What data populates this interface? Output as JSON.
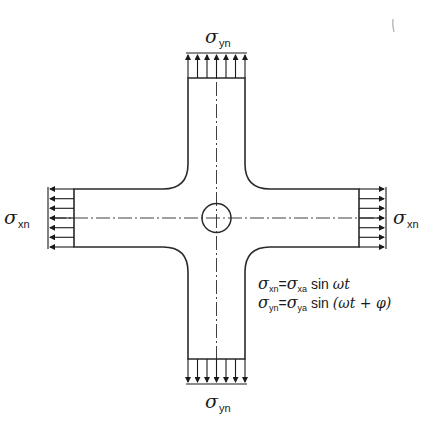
{
  "diagram": {
    "type": "cruciform specimen under biaxial sinusoidal loading",
    "colors": {
      "line": "#2a2a2a",
      "background": "#ffffff"
    },
    "labels": {
      "top": {
        "symbol": "σ",
        "sub": "yn"
      },
      "bottom": {
        "symbol": "σ",
        "sub": "yn"
      },
      "left": {
        "symbol": "σ",
        "sub": "xn"
      },
      "right": {
        "symbol": "σ",
        "sub": "xn"
      }
    },
    "equations": [
      {
        "lhs_symbol": "σ",
        "lhs_sub": "xn",
        "eq": "=",
        "rhs_symbol": "σ",
        "rhs_sub": "xa",
        "fn": " sin ",
        "arg": "ωt"
      },
      {
        "lhs_symbol": "σ",
        "lhs_sub": "yn",
        "eq": "=",
        "rhs_symbol": "σ",
        "rhs_sub": "ya",
        "fn": " sin ",
        "arg": "(ωt + φ)"
      }
    ],
    "arrow_count_per_side": 7
  }
}
